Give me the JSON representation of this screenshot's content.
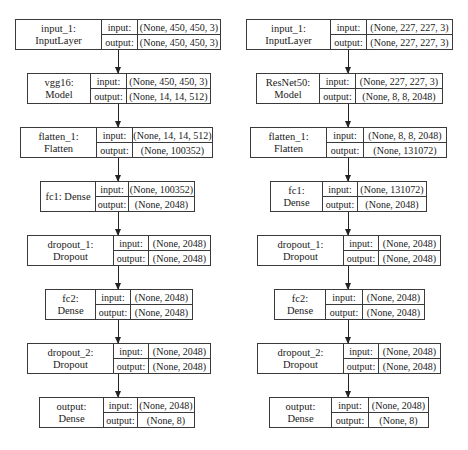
{
  "io_labels": {
    "input": "input:",
    "output": "output:"
  },
  "left_model": {
    "layers": [
      {
        "name": "input_1: InputLayer",
        "input": "(None, 450, 450, 3)",
        "output": "(None, 450, 450, 3)"
      },
      {
        "name": "vgg16: Model",
        "input": "(None, 450, 450, 3)",
        "output": "(None, 14, 14, 512)"
      },
      {
        "name": "flatten_1: Flatten",
        "input": "(None, 14, 14, 512)",
        "output": "(None, 100352)"
      },
      {
        "name": "fc1: Dense",
        "input": "(None, 100352)",
        "output": "(None, 2048)"
      },
      {
        "name": "dropout_1: Dropout",
        "input": "(None, 2048)",
        "output": "(None, 2048)"
      },
      {
        "name": "fc2: Dense",
        "input": "(None, 2048)",
        "output": "(None, 2048)"
      },
      {
        "name": "dropout_2: Dropout",
        "input": "(None, 2048)",
        "output": "(None, 2048)"
      },
      {
        "name": "output: Dense",
        "input": "(None, 2048)",
        "output": "(None, 8)"
      }
    ]
  },
  "right_model": {
    "layers": [
      {
        "name": "input_1: InputLayer",
        "input": "(None, 227, 227, 3)",
        "output": "(None, 227, 227, 3)"
      },
      {
        "name": "ResNet50: Model",
        "input": "(None, 227, 227, 3)",
        "output": "(None, 8, 8, 2048)"
      },
      {
        "name": "flatten_1: Flatten",
        "input": "(None, 8, 8, 2048)",
        "output": "(None, 131072)"
      },
      {
        "name": "fc1: Dense",
        "input": "(None, 131072)",
        "output": "(None, 2048)"
      },
      {
        "name": "dropout_1: Dropout",
        "input": "(None, 2048)",
        "output": "(None, 2048)"
      },
      {
        "name": "fc2: Dense",
        "input": "(None, 2048)",
        "output": "(None, 2048)"
      },
      {
        "name": "dropout_2: Dropout",
        "input": "(None, 2048)",
        "output": "(None, 2048)"
      },
      {
        "name": "output: Dense",
        "input": "(None, 2048)",
        "output": "(None, 8)"
      }
    ]
  }
}
